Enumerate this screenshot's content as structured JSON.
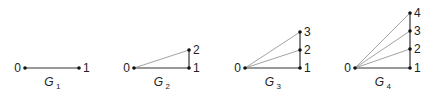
{
  "graphs": [
    {
      "name": "G",
      "subscript": "1",
      "vertices": [
        {
          "id": "0",
          "x": 25,
          "y": 68
        },
        {
          "id": "1",
          "x": 79,
          "y": 68
        }
      ],
      "edges": [
        [
          "0",
          "1"
        ]
      ]
    },
    {
      "name": "G",
      "subscript": "2",
      "vertices": [
        {
          "id": "0",
          "x": 134,
          "y": 68
        },
        {
          "id": "1",
          "x": 189,
          "y": 68
        },
        {
          "id": "2",
          "x": 189,
          "y": 50
        }
      ],
      "edges": [
        [
          "0",
          "1"
        ],
        [
          "1",
          "2"
        ],
        [
          "0",
          "2"
        ]
      ]
    },
    {
      "name": "G",
      "subscript": "3",
      "vertices": [
        {
          "id": "0",
          "x": 245,
          "y": 68
        },
        {
          "id": "1",
          "x": 300,
          "y": 68
        },
        {
          "id": "2",
          "x": 300,
          "y": 50
        },
        {
          "id": "3",
          "x": 300,
          "y": 32
        }
      ],
      "edges": [
        [
          "0",
          "1"
        ],
        [
          "1",
          "2"
        ],
        [
          "2",
          "3"
        ],
        [
          "0",
          "2"
        ],
        [
          "0",
          "3"
        ]
      ]
    },
    {
      "name": "G",
      "subscript": "4",
      "vertices": [
        {
          "id": "0",
          "x": 355,
          "y": 68
        },
        {
          "id": "1",
          "x": 410,
          "y": 68
        },
        {
          "id": "2",
          "x": 410,
          "y": 49
        },
        {
          "id": "3",
          "x": 410,
          "y": 31
        },
        {
          "id": "4",
          "x": 410,
          "y": 13
        }
      ],
      "edges": [
        [
          "0",
          "1"
        ],
        [
          "1",
          "2"
        ],
        [
          "2",
          "3"
        ],
        [
          "3",
          "4"
        ],
        [
          "0",
          "2"
        ],
        [
          "0",
          "3"
        ],
        [
          "0",
          "4"
        ]
      ]
    }
  ]
}
